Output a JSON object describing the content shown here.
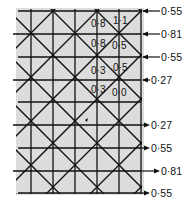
{
  "diagram": {
    "background_color": "#dcdcdc",
    "line_color": "#111111",
    "right_labels": [
      {
        "text": "0·55",
        "y": 11,
        "arrow": "in"
      },
      {
        "text": "0·81",
        "y": 34,
        "arrow": "in"
      },
      {
        "text": "0·55",
        "y": 57,
        "arrow": "in"
      },
      {
        "text": "0·27",
        "y": 80,
        "arrow": "in"
      },
      {
        "text": "0·27",
        "y": 125,
        "arrow": "out"
      },
      {
        "text": "0·55",
        "y": 148,
        "arrow": "out"
      },
      {
        "text": "0·81",
        "y": 171,
        "arrow": "out"
      },
      {
        "text": "0·55",
        "y": 193,
        "arrow": "out"
      }
    ],
    "cell_labels": [
      {
        "text": "0·8",
        "x": 91,
        "y": 27
      },
      {
        "text": "1·1",
        "x": 113,
        "y": 24
      },
      {
        "text": "0·8",
        "x": 91,
        "y": 47
      },
      {
        "text": "0·5",
        "x": 112,
        "y": 49
      },
      {
        "text": "0·5",
        "x": 113,
        "y": 71
      },
      {
        "text": "0·3",
        "x": 91,
        "y": 74
      },
      {
        "text": "0·3",
        "x": 91,
        "y": 93
      },
      {
        "text": "0·0",
        "x": 112,
        "y": 96
      }
    ]
  }
}
